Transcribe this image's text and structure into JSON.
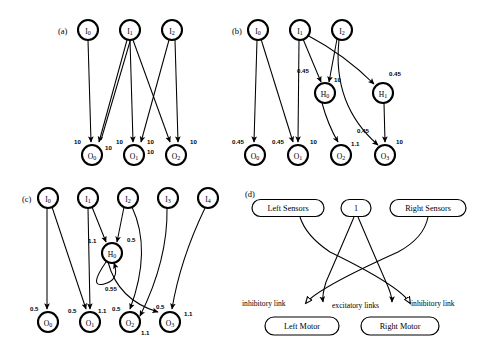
{
  "figure": {
    "panels": [
      {
        "id": "a",
        "caption": "(a)",
        "nodes": [
          {
            "name": "I0",
            "base": "I",
            "sub": "0",
            "x": 88,
            "y": 30
          },
          {
            "name": "I1",
            "base": "I",
            "sub": "1",
            "x": 130,
            "y": 30
          },
          {
            "name": "I2",
            "base": "I",
            "sub": "2",
            "x": 172,
            "y": 30
          },
          {
            "name": "O0",
            "base": "O",
            "sub": "0",
            "x": 92,
            "y": 155
          },
          {
            "name": "O1",
            "base": "O",
            "sub": "1",
            "x": 134,
            "y": 155
          },
          {
            "name": "O2",
            "base": "O",
            "sub": "2",
            "x": 176,
            "y": 155
          }
        ],
        "weights": [
          {
            "text": "10",
            "x": 74,
            "y": 141
          },
          {
            "text": "10",
            "x": 105,
            "y": 147
          },
          {
            "text": "10",
            "x": 116,
            "y": 141
          },
          {
            "text": "10",
            "x": 147,
            "y": 141
          },
          {
            "text": "10",
            "x": 147,
            "y": 151
          },
          {
            "text": "10",
            "x": 190,
            "y": 141
          }
        ]
      },
      {
        "id": "b",
        "caption": "(b)",
        "nodes": [
          {
            "name": "I0",
            "base": "I",
            "sub": "0",
            "x": 258,
            "y": 30
          },
          {
            "name": "I1",
            "base": "I",
            "sub": "1",
            "x": 300,
            "y": 30
          },
          {
            "name": "I2",
            "base": "I",
            "sub": "2",
            "x": 342,
            "y": 30
          },
          {
            "name": "H0",
            "base": "H",
            "sub": "0",
            "x": 325,
            "y": 93
          },
          {
            "name": "H1",
            "base": "H",
            "sub": "1",
            "x": 383,
            "y": 93
          },
          {
            "name": "O0",
            "base": "O",
            "sub": "0",
            "x": 255,
            "y": 155
          },
          {
            "name": "O1",
            "base": "O",
            "sub": "1",
            "x": 298,
            "y": 155
          },
          {
            "name": "O2",
            "base": "O",
            "sub": "2",
            "x": 341,
            "y": 155
          },
          {
            "name": "O3",
            "base": "O",
            "sub": "3",
            "x": 385,
            "y": 155
          }
        ],
        "weights": [
          {
            "text": "0.45",
            "x": 297,
            "y": 70
          },
          {
            "text": "10",
            "x": 334,
            "y": 79
          },
          {
            "text": "0.45",
            "x": 389,
            "y": 73
          },
          {
            "text": "0.45",
            "x": 232,
            "y": 141
          },
          {
            "text": "0.45",
            "x": 272,
            "y": 141
          },
          {
            "text": "10",
            "x": 310,
            "y": 141
          },
          {
            "text": "1.1",
            "x": 351,
            "y": 143
          },
          {
            "text": "0.45",
            "x": 357,
            "y": 130
          },
          {
            "text": "10",
            "x": 396,
            "y": 141
          }
        ]
      },
      {
        "id": "c",
        "caption": "(c)",
        "nodes": [
          {
            "name": "I0",
            "base": "I",
            "sub": "0",
            "x": 48,
            "y": 198
          },
          {
            "name": "I1",
            "base": "I",
            "sub": "1",
            "x": 88,
            "y": 198
          },
          {
            "name": "I2",
            "base": "I",
            "sub": "2",
            "x": 128,
            "y": 198
          },
          {
            "name": "I3",
            "base": "I",
            "sub": "3",
            "x": 168,
            "y": 198
          },
          {
            "name": "I4",
            "base": "I",
            "sub": "4",
            "x": 208,
            "y": 198
          },
          {
            "name": "H0",
            "base": "H",
            "sub": "0",
            "x": 112,
            "y": 253
          },
          {
            "name": "O0",
            "base": "O",
            "sub": "0",
            "x": 48,
            "y": 322
          },
          {
            "name": "O1",
            "base": "O",
            "sub": "1",
            "x": 90,
            "y": 322
          },
          {
            "name": "O2",
            "base": "O",
            "sub": "2",
            "x": 130,
            "y": 322
          },
          {
            "name": "O3",
            "base": "O",
            "sub": "3",
            "x": 170,
            "y": 322
          }
        ],
        "weights": [
          {
            "text": "1.1",
            "x": 88,
            "y": 240
          },
          {
            "text": "0.5",
            "x": 127,
            "y": 239
          },
          {
            "text": "0.55",
            "x": 105,
            "y": 288
          },
          {
            "text": "0.5",
            "x": 30,
            "y": 308
          },
          {
            "text": "0.5",
            "x": 68,
            "y": 310
          },
          {
            "text": "1.1",
            "x": 98,
            "y": 310
          },
          {
            "text": "0.5",
            "x": 112,
            "y": 308
          },
          {
            "text": "1.1",
            "x": 141,
            "y": 332
          },
          {
            "text": "0.5",
            "x": 156,
            "y": 306
          },
          {
            "text": "1.1",
            "x": 184,
            "y": 313
          }
        ]
      },
      {
        "id": "d",
        "caption": "(d)",
        "boxes": [
          {
            "name": "left-sensors",
            "label": "Left Sensors",
            "x": 288,
            "y": 208,
            "w": 72,
            "h": 17
          },
          {
            "name": "bias",
            "label": "1",
            "x": 356,
            "y": 208,
            "w": 30,
            "h": 17
          },
          {
            "name": "right-sensors",
            "label": "Right Sensors",
            "x": 428,
            "y": 208,
            "w": 76,
            "h": 17
          },
          {
            "name": "left-motor",
            "label": "Left Motor",
            "x": 302,
            "y": 326,
            "w": 74,
            "h": 18
          },
          {
            "name": "right-motor",
            "label": "Right Motor",
            "x": 400,
            "y": 326,
            "w": 78,
            "h": 18
          }
        ],
        "notes": [
          {
            "name": "inhibitory-link-left",
            "text": "inhibitory link",
            "x": 242,
            "y": 303,
            "anchor": "start"
          },
          {
            "name": "excitatory-links",
            "text": "excitatory links",
            "x": 318,
            "y": 305,
            "anchor": "start"
          },
          {
            "name": "inhibitory-link-right",
            "text": "inhibitory link",
            "x": 411,
            "y": 303,
            "anchor": "start"
          }
        ]
      }
    ]
  }
}
